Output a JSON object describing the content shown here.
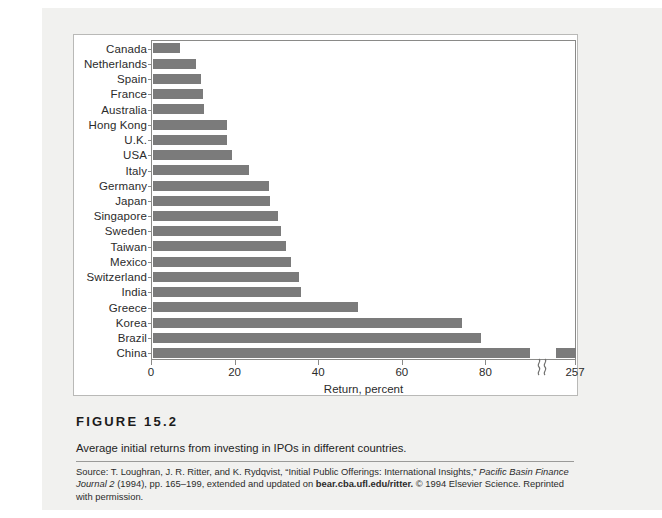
{
  "figure": {
    "number_label": "FIGURE 15.2",
    "description": "Average initial returns from investing in IPOs in different countries.",
    "source": {
      "lead": "Source: T. Loughran, J. R. Ritter, and K. Rydqvist, “Initial Public Offerings: International Insights,” ",
      "italic_journal": "Pacific Basin Finance Journal 2",
      "mid": " (1994), pp. 165–199, extended and updated on ",
      "bold_url": "bear.cba.ufl.edu/ritter.",
      "tail": " © 1994 Elsevier Science. Reprinted with permission."
    }
  },
  "colors": {
    "bar": "#7b7b7b",
    "axis": "#8a8a88",
    "frame": "#b9b9b7",
    "page": "#f1f1ef",
    "text": "#2b2b2b"
  },
  "chart_data": {
    "type": "bar",
    "orientation": "horizontal",
    "title": "",
    "xlabel": "Return, percent",
    "ylabel": "",
    "xlim": [
      0,
      100
    ],
    "grid": false,
    "legend": "none",
    "axis_break": {
      "present": true,
      "at": 92,
      "final_tick_value": 257,
      "final_tick_label": "257"
    },
    "xticks": [
      0,
      20,
      40,
      60,
      80
    ],
    "xtick_labels": [
      "0",
      "20",
      "40",
      "60",
      "80",
      "257"
    ],
    "categories": [
      "Canada",
      "Netherlands",
      "Spain",
      "France",
      "Australia",
      "Hong Kong",
      "U.K.",
      "USA",
      "Italy",
      "Germany",
      "Japan",
      "Singapore",
      "Sweden",
      "Taiwan",
      "Mexico",
      "Switzerland",
      "India",
      "Greece",
      "Korea",
      "Brazil",
      "China"
    ],
    "values": [
      6.5,
      10.2,
      11.5,
      12.0,
      12.1,
      17.6,
      17.6,
      19.0,
      23.0,
      27.7,
      28.0,
      30.0,
      30.5,
      31.7,
      33.0,
      34.9,
      35.3,
      49.0,
      74.0,
      78.5,
      257.0
    ]
  }
}
